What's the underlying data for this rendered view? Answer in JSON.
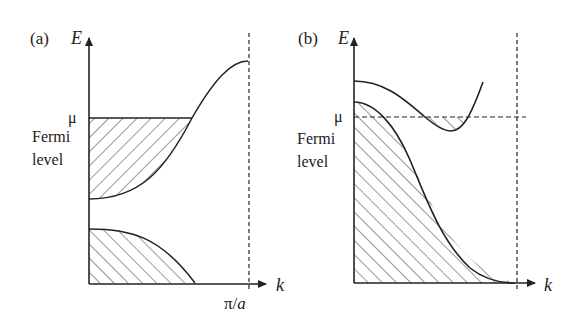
{
  "panels": [
    {
      "id": "a",
      "tag": "(a)",
      "y_axis_label": "E",
      "x_axis_label": "k",
      "mu_label": "μ",
      "fermi_label_line1": "Fermi",
      "fermi_label_line2": "level",
      "boundary_label_pi": "π/",
      "boundary_label_a": "a",
      "description": "Insulator/metal with two bands; lower band fully filled, upper band partially filled up to Fermi level μ"
    },
    {
      "id": "b",
      "tag": "(b)",
      "y_axis_label": "E",
      "x_axis_label": "k",
      "mu_label": "μ",
      "fermi_label_line1": "Fermi",
      "fermi_label_line2": "level",
      "description": "Overlapping bands (semimetal); lower band nearly filled below μ, upper band pocket filled below μ"
    }
  ],
  "colors": {
    "ink": "#222222",
    "background": "#ffffff"
  }
}
